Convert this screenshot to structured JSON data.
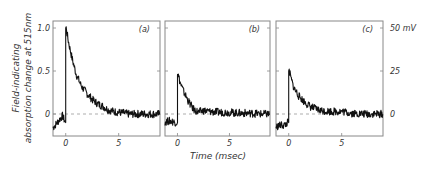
{
  "chart_data": {
    "type": "line",
    "title": "",
    "xlabel": "Time (msec)",
    "ylabel_left": [
      "Field-indicating",
      "absorption change at 515nm"
    ],
    "ylabel_right_unit": "mV",
    "xlim": [
      -1.2,
      8.9
    ],
    "ylim_left": [
      -0.2,
      1.05
    ],
    "ylim_right": [
      -10,
      52.5
    ],
    "xticks": [
      0,
      5
    ],
    "xtick_labels": [
      "0",
      "5"
    ],
    "yticks_left": [
      0,
      0.5,
      1.0
    ],
    "ytick_labels_left": [
      "0",
      "0.5",
      "1.0"
    ],
    "yticks_right": [
      0,
      25,
      50
    ],
    "ytick_labels_right": [
      "0",
      "25",
      "50 mV"
    ],
    "baseline_dashed": 0,
    "grid": false,
    "panels": [
      {
        "label": "(a)",
        "series": {
          "x": [
            -1.2,
            -0.8,
            -0.5,
            -0.3,
            -0.1,
            0.0,
            0.05,
            0.2,
            0.5,
            0.8,
            1.0,
            1.5,
            2.0,
            2.5,
            3.0,
            3.5,
            4.0,
            4.5,
            5.0,
            6.0,
            7.0,
            8.0,
            8.9
          ],
          "y": [
            -0.16,
            -0.1,
            -0.05,
            -0.02,
            -0.08,
            -0.1,
            1.0,
            0.88,
            0.7,
            0.55,
            0.46,
            0.32,
            0.24,
            0.17,
            0.12,
            0.09,
            0.05,
            0.03,
            0.02,
            0.0,
            0.0,
            0.0,
            0.0
          ]
        }
      },
      {
        "label": "(b)",
        "series": {
          "x": [
            -1.2,
            -0.8,
            -0.4,
            -0.1,
            0.0,
            0.05,
            0.3,
            0.6,
            1.0,
            1.5,
            2.0,
            2.5,
            3.0,
            4.0,
            5.0,
            6.0,
            7.0,
            8.0,
            8.9
          ],
          "y": [
            -0.09,
            -0.08,
            -0.09,
            -0.1,
            -0.1,
            0.46,
            0.35,
            0.26,
            0.16,
            0.06,
            0.02,
            0.04,
            0.03,
            0.02,
            0.02,
            0.01,
            0.01,
            0.0,
            0.0
          ]
        }
      },
      {
        "label": "(c)",
        "series": {
          "x": [
            -1.2,
            -0.8,
            -0.4,
            -0.1,
            0.0,
            0.05,
            0.2,
            0.5,
            1.0,
            1.5,
            2.0,
            2.5,
            3.0,
            4.0,
            5.0,
            6.0,
            7.0,
            8.0,
            8.9
          ],
          "y": [
            -0.15,
            -0.13,
            -0.13,
            -0.1,
            -0.1,
            0.5,
            0.42,
            0.3,
            0.2,
            0.14,
            0.09,
            0.06,
            0.04,
            0.03,
            0.03,
            0.01,
            0.0,
            0.0,
            0.0
          ]
        }
      }
    ]
  }
}
